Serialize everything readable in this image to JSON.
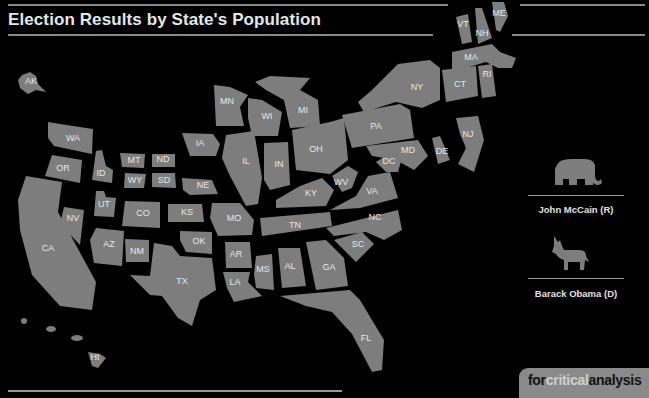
{
  "header": {
    "title": "Election Results by State's Population"
  },
  "map": {
    "fill_color": "#7d7d7d",
    "background_color": "#000000",
    "states": [
      {
        "abbr": "AK",
        "x": 31,
        "y": 82
      },
      {
        "abbr": "WA",
        "x": 73,
        "y": 139
      },
      {
        "abbr": "OR",
        "x": 63,
        "y": 169
      },
      {
        "abbr": "CA",
        "x": 48,
        "y": 249
      },
      {
        "abbr": "NV",
        "x": 73,
        "y": 219
      },
      {
        "abbr": "ID",
        "x": 101,
        "y": 174
      },
      {
        "abbr": "MT",
        "x": 134,
        "y": 161
      },
      {
        "abbr": "WY",
        "x": 135,
        "y": 181
      },
      {
        "abbr": "UT",
        "x": 104,
        "y": 205
      },
      {
        "abbr": "AZ",
        "x": 109,
        "y": 245
      },
      {
        "abbr": "CO",
        "x": 143,
        "y": 214
      },
      {
        "abbr": "NM",
        "x": 137,
        "y": 252
      },
      {
        "abbr": "ND",
        "x": 163,
        "y": 160
      },
      {
        "abbr": "SD",
        "x": 164,
        "y": 181
      },
      {
        "abbr": "NE",
        "x": 203,
        "y": 186
      },
      {
        "abbr": "KS",
        "x": 187,
        "y": 213
      },
      {
        "abbr": "OK",
        "x": 199,
        "y": 242
      },
      {
        "abbr": "TX",
        "x": 182,
        "y": 282
      },
      {
        "abbr": "MN",
        "x": 227,
        "y": 102
      },
      {
        "abbr": "IA",
        "x": 200,
        "y": 144
      },
      {
        "abbr": "MO",
        "x": 234,
        "y": 219
      },
      {
        "abbr": "AR",
        "x": 236,
        "y": 255
      },
      {
        "abbr": "LA",
        "x": 235,
        "y": 283
      },
      {
        "abbr": "WI",
        "x": 267,
        "y": 117
      },
      {
        "abbr": "IL",
        "x": 246,
        "y": 162
      },
      {
        "abbr": "MI",
        "x": 303,
        "y": 111
      },
      {
        "abbr": "IN",
        "x": 279,
        "y": 165
      },
      {
        "abbr": "OH",
        "x": 316,
        "y": 150
      },
      {
        "abbr": "KY",
        "x": 311,
        "y": 194
      },
      {
        "abbr": "TN",
        "x": 295,
        "y": 226
      },
      {
        "abbr": "MS",
        "x": 263,
        "y": 270
      },
      {
        "abbr": "AL",
        "x": 290,
        "y": 267
      },
      {
        "abbr": "GA",
        "x": 329,
        "y": 268
      },
      {
        "abbr": "FL",
        "x": 366,
        "y": 339
      },
      {
        "abbr": "SC",
        "x": 358,
        "y": 245
      },
      {
        "abbr": "NC",
        "x": 375,
        "y": 218
      },
      {
        "abbr": "VA",
        "x": 372,
        "y": 192
      },
      {
        "abbr": "WV",
        "x": 341,
        "y": 183
      },
      {
        "abbr": "PA",
        "x": 376,
        "y": 127
      },
      {
        "abbr": "NY",
        "x": 417,
        "y": 88
      },
      {
        "abbr": "MD",
        "x": 408,
        "y": 151
      },
      {
        "abbr": "DC",
        "x": 389,
        "y": 162
      },
      {
        "abbr": "DE",
        "x": 442,
        "y": 152
      },
      {
        "abbr": "NJ",
        "x": 468,
        "y": 135
      },
      {
        "abbr": "CT",
        "x": 460,
        "y": 85
      },
      {
        "abbr": "RI",
        "x": 487,
        "y": 75
      },
      {
        "abbr": "MA",
        "x": 471,
        "y": 58
      },
      {
        "abbr": "VT",
        "x": 463,
        "y": 25
      },
      {
        "abbr": "NH",
        "x": 482,
        "y": 34
      },
      {
        "abbr": "ME",
        "x": 499,
        "y": 14
      },
      {
        "abbr": "HI",
        "x": 95,
        "y": 358
      }
    ]
  },
  "legend": {
    "items": [
      {
        "icon": "elephant-icon",
        "label": "John McCain (R)"
      },
      {
        "icon": "donkey-icon",
        "label": "Barack Obama (D)"
      }
    ]
  },
  "badge": {
    "part1": "for",
    "part2": "critical",
    "part3": "analysis"
  }
}
